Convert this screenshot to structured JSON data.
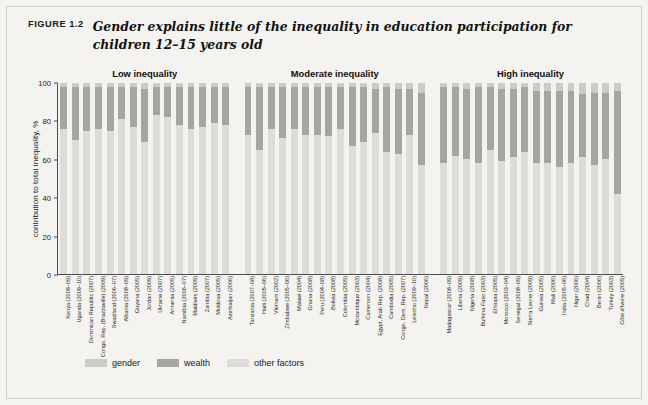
{
  "figure": {
    "label": "FIGURE 1.2",
    "title": "Gender explains little of the inequality in education participation for children 12–15 years old"
  },
  "legend": {
    "items": [
      {
        "name": "gender",
        "label": "gender",
        "color": "#cccbc7"
      },
      {
        "name": "wealth",
        "label": "wealth",
        "color": "#a5a5a2"
      },
      {
        "name": "other-factors",
        "label": "other factors",
        "color": "#dddcd8"
      }
    ]
  },
  "chart_data": {
    "type": "bar",
    "stacked": true,
    "title": "Gender explains little of the inequality in education participation for children 12–15 years old",
    "xlabel": "",
    "ylabel": "contribution to total inequality, %",
    "ylim": [
      0,
      100
    ],
    "yticks": [
      0,
      20,
      40,
      60,
      80,
      100
    ],
    "ytick_labels": [
      "0",
      "20",
      "40",
      "60",
      "80",
      "100"
    ],
    "grid": false,
    "legend_position": "bottom-left",
    "series": [
      {
        "name": "gender",
        "color": "#cccbc7"
      },
      {
        "name": "wealth",
        "color": "#a5a5a2"
      },
      {
        "name": "other factors",
        "color": "#dddcd8"
      }
    ],
    "groups": [
      {
        "name": "Low inequality",
        "categories": [
          "Kenya (2008–09)",
          "Uganda (2009–10)",
          "Dominican Republic (2007)",
          "Congo, Rep. (Brazzaville) (2009)",
          "Swaziland (2006–07)",
          "Albania (2008–09)",
          "Guyana (2005)",
          "Jordan (2009)",
          "Ukraine (2007)",
          "Armenia (2005)",
          "Namibia (2006–07)",
          "Maldives (2009)",
          "Zambia (2007)",
          "Moldova (2005)",
          "Azerbaijan (2006)"
        ],
        "gender": [
          2,
          2,
          2,
          2,
          2,
          2,
          2,
          3,
          2,
          2,
          2,
          2,
          2,
          2,
          2
        ],
        "wealth": [
          22,
          28,
          23,
          22,
          23,
          17,
          21,
          28,
          15,
          16,
          20,
          22,
          21,
          19,
          20
        ],
        "other_factors": [
          76,
          70,
          75,
          76,
          75,
          81,
          77,
          69,
          83,
          82,
          78,
          76,
          77,
          79,
          78
        ]
      },
      {
        "name": "Moderate inequality",
        "categories": [
          "Tanzania (2007–08)",
          "Haiti (2005–06)",
          "Vietnam (2002)",
          "Zimbabwe (2005–06)",
          "Malawi (2004)",
          "Ghana (2008)",
          "Peru (2004–08)",
          "Bolivia (2008)",
          "Colombia (2005)",
          "Mozambique (2003)",
          "Cameroon (2004)",
          "Egypt, Arab Rep. (2008)",
          "Cambodia (2005)",
          "Congo, Dem. Rep. (2007)",
          "Lesotho (2009–10)",
          "Nepal (2006)"
        ],
        "gender": [
          2,
          2,
          2,
          2,
          2,
          2,
          2,
          2,
          2,
          2,
          2,
          3,
          2,
          3,
          3,
          5
        ],
        "wealth": [
          25,
          33,
          22,
          27,
          22,
          25,
          25,
          26,
          22,
          31,
          29,
          23,
          34,
          34,
          24,
          38
        ],
        "other_factors": [
          73,
          65,
          76,
          71,
          76,
          73,
          73,
          72,
          76,
          67,
          69,
          74,
          64,
          63,
          73,
          57
        ]
      },
      {
        "name": "High inequality",
        "categories": [
          "Madagascar (2008–09)",
          "Liberia (2009)",
          "Nigeria (2008)",
          "Burkina Faso (2003)",
          "Ethiopia (2005)",
          "Morocco (2003–04)",
          "Senegal (2008–09)",
          "Sierra Leone (2009)",
          "Guinea (2005)",
          "Mali (2006)",
          "India (2005–06)",
          "Niger (2006)",
          "Chad (2004)",
          "Benin (2006)",
          "Turkey (2003)",
          "Côte d'Ivoire (2005)"
        ],
        "gender": [
          2,
          2,
          3,
          2,
          2,
          3,
          3,
          2,
          4,
          4,
          4,
          4,
          6,
          5,
          5,
          4
        ],
        "wealth": [
          40,
          36,
          37,
          40,
          33,
          38,
          36,
          34,
          38,
          38,
          40,
          38,
          33,
          38,
          35,
          54
        ],
        "other_factors": [
          58,
          62,
          60,
          58,
          65,
          59,
          61,
          64,
          58,
          58,
          56,
          58,
          61,
          57,
          60,
          42
        ]
      }
    ]
  }
}
